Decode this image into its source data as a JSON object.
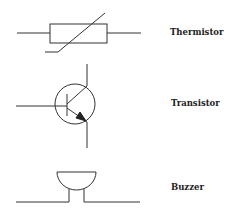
{
  "symbols": [
    {
      "name": "thermistor",
      "label": "Thermistor"
    },
    {
      "name": "transistor",
      "label": "Transistor"
    },
    {
      "name": "buzzer",
      "label": "Buzzer"
    }
  ],
  "colors": {
    "stroke": "#333333",
    "background": "#ffffff"
  }
}
